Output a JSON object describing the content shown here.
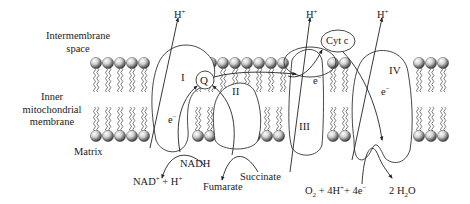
{
  "regions": {
    "intermembrane_space": [
      "Intermembrane",
      "space"
    ],
    "inner_membrane": [
      "Inner",
      "mitochondrial",
      "membrane"
    ],
    "matrix": "Matrix"
  },
  "complexes": {
    "complex_1": "I",
    "complex_2": "II",
    "complex_3": "III",
    "complex_4": "IV",
    "ubiquinone": "Q",
    "cytochrome_c": "Cyt c"
  },
  "protons": {
    "label": "H",
    "charge": "+"
  },
  "electrons": {
    "label": "e",
    "charge": "−"
  },
  "reactions": {
    "nadh": "NADH",
    "nad_product": {
      "base": "NAD",
      "sup": "+",
      "rest": " + H",
      "sup2": "+"
    },
    "succinate": "Succinate",
    "fumarate": "Fumarate",
    "oxygen": {
      "o": "O",
      "sub": "2",
      "mid": " + 4H",
      "sup": "+",
      "mid2": "+ 4e",
      "sup2": "−"
    },
    "water": {
      "pre": "2 H",
      "sub": "2",
      "post": "O"
    }
  },
  "colors": {
    "line": "#333333",
    "text": "#222222",
    "lipid_head_light": "#f4f4f4",
    "lipid_head_dark": "#555555"
  }
}
